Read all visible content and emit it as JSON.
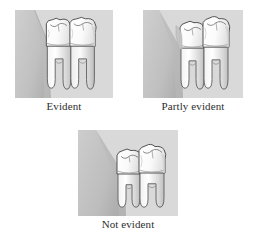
{
  "figure": {
    "panels": [
      {
        "id": "evident",
        "label": "Evident",
        "description": "Both molar crowns fully exposed above the gum line; gum tissue slopes away to the left of the teeth.",
        "gum_coverage": "none",
        "teeth_count": 2
      },
      {
        "id": "partly-evident",
        "label": "Partly evident",
        "description": "Gum tissue overlaps the side of the first molar crown, partially covering it.",
        "gum_coverage": "partial",
        "teeth_count": 2
      },
      {
        "id": "not-evident",
        "label": "Not evident",
        "description": "Gum tissue extends over the molars so the crowns sit below the gum margin.",
        "gum_coverage": "full",
        "teeth_count": 2
      }
    ]
  },
  "colors": {
    "panel_background": "#d8d8d8",
    "gum_fill": "#c6c6c6",
    "gum_shadow": "#b4b4b4",
    "enamel_light": "#fdfdfd",
    "enamel_mid": "#ededed",
    "dentin_shade": "#d2d2d2",
    "outline": "#4a4a4a",
    "label_text": "#2e2e2e",
    "page_background": "#ffffff"
  }
}
